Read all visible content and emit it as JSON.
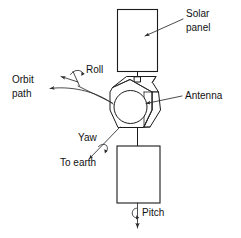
{
  "figure": {
    "background_color": "#ffffff",
    "ink_color": "#1b1b1b"
  },
  "labels": {
    "solar_panel_line1": "Solar",
    "solar_panel_line2": "panel",
    "antenna": "Antenna",
    "orbit_path_line1": "Orbit",
    "orbit_path_line2": "path",
    "roll": "Roll",
    "yaw": "Yaw",
    "to_earth": "To earth",
    "pitch": "Pitch"
  },
  "components": [
    {
      "name": "solar-panel",
      "label": "Solar panel",
      "shape": "rectangle"
    },
    {
      "name": "spacecraft-body",
      "label": "Spacecraft body",
      "shape": "hexagonal-prism"
    },
    {
      "name": "antenna-dish",
      "label": "Antenna",
      "shape": "circle"
    },
    {
      "name": "lower-panel",
      "label": "Lower panel",
      "shape": "rectangle"
    }
  ],
  "axes": [
    {
      "name": "roll-axis",
      "label": "Roll",
      "direction": "up-left",
      "rotation": "curved-arrow"
    },
    {
      "name": "yaw-axis",
      "label": "Yaw",
      "direction": "down-left",
      "rotation": "curved-arrow"
    },
    {
      "name": "pitch-axis",
      "label": "Pitch",
      "direction": "down",
      "rotation": "loop-arrow"
    }
  ],
  "annotations": [
    {
      "name": "orbit-path-arrow",
      "label": "Orbit path",
      "direction": "left"
    },
    {
      "name": "to-earth-arrow",
      "label": "To earth",
      "direction": "down-left"
    }
  ]
}
